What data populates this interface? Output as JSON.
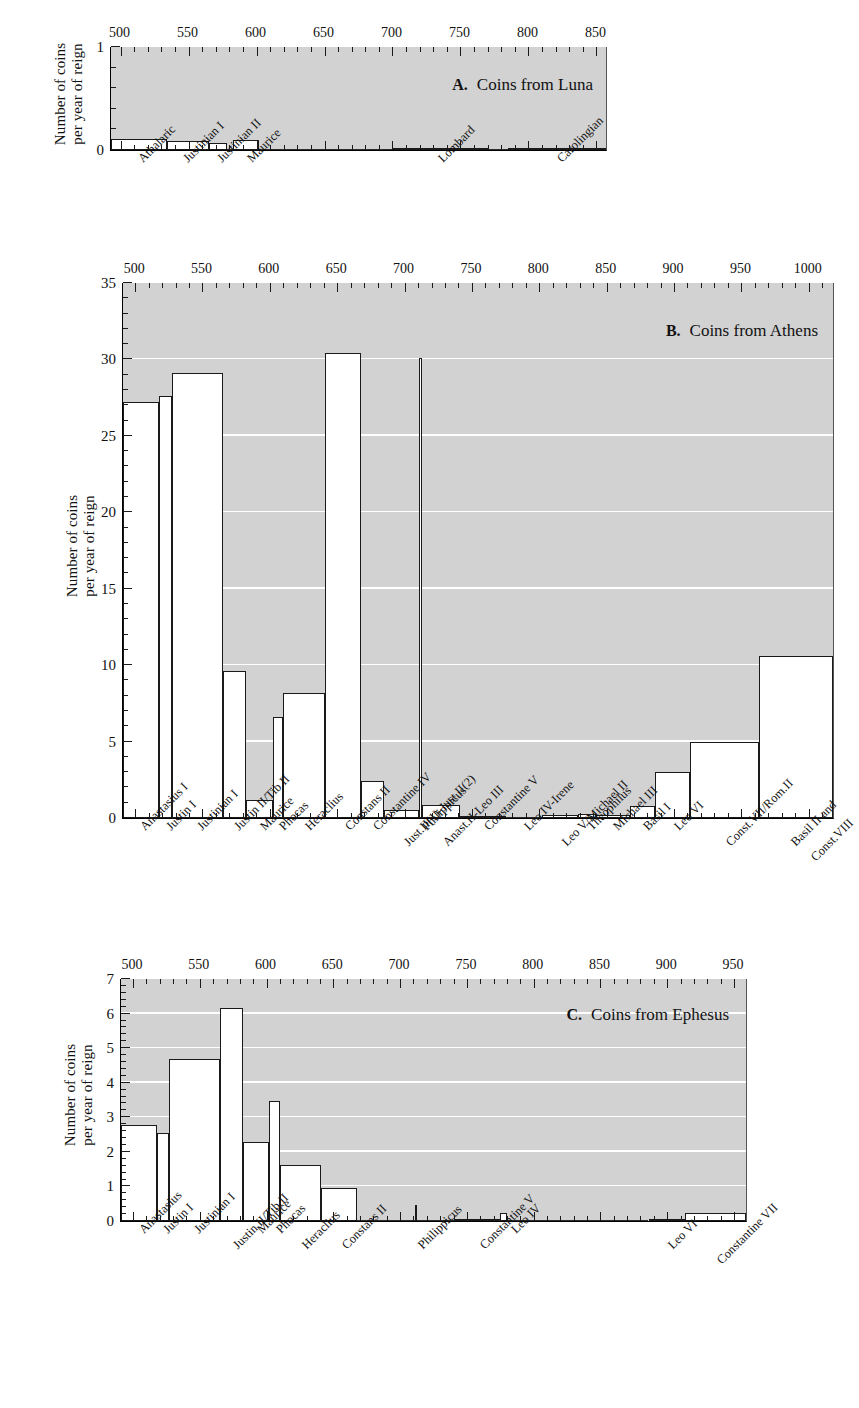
{
  "figure": {
    "y_axis_title_line1": "Number of coins",
    "y_axis_title_line2": "per year of reign"
  },
  "chart_data": [
    {
      "id": "A",
      "type": "bar",
      "title": "Coins from Luna",
      "panel_letter": "A.",
      "xlabel": "",
      "ylabel": "Number of coins per year of reign",
      "ylim": [
        0,
        1
      ],
      "yticks": [
        0,
        1
      ],
      "xlim": [
        493,
        857
      ],
      "xticks": [
        500,
        550,
        600,
        650,
        700,
        750,
        800,
        850
      ],
      "xtick_labels": [
        "500",
        "550",
        "600",
        "650",
        "700",
        "750",
        "800",
        "850"
      ],
      "minor_tick_step": 10,
      "grid": false,
      "categories": [
        "Athalaric",
        "Justinian I",
        "Justinian II",
        "Maurice",
        "Lombard",
        "Carolingian"
      ],
      "bars": [
        {
          "label": "Athalaric",
          "start": 493,
          "end": 534,
          "value": 0.105
        },
        {
          "label": "Justinian I",
          "start": 534,
          "end": 565,
          "value": 0.085
        },
        {
          "label": "Justinian II",
          "start": 565,
          "end": 578,
          "value": 0.065
        },
        {
          "label": "",
          "start": 578,
          "end": 583,
          "value": 0.0
        },
        {
          "label": "Maurice",
          "start": 583,
          "end": 602,
          "value": 0.095
        },
        {
          "label": "",
          "start": 602,
          "end": 700,
          "value": 0.005
        },
        {
          "label": "Lombard",
          "start": 700,
          "end": 770,
          "value": 0.018
        },
        {
          "label": "",
          "start": 770,
          "end": 785,
          "value": 0.004
        },
        {
          "label": "Carolingian",
          "start": 785,
          "end": 857,
          "value": 0.016
        }
      ]
    },
    {
      "id": "B",
      "type": "bar",
      "title": "Coins from Athens",
      "panel_letter": "B.",
      "xlabel": "",
      "ylabel": "Number of coins per year of reign",
      "ylim": [
        0,
        35
      ],
      "yticks": [
        0,
        5,
        10,
        15,
        20,
        25,
        30,
        35
      ],
      "ytick_labels": [
        "0",
        "5",
        "10",
        "15",
        "20",
        "25",
        "30",
        "35"
      ],
      "xlim": [
        491,
        1018
      ],
      "xticks": [
        500,
        550,
        600,
        650,
        700,
        750,
        800,
        850,
        900,
        950,
        1000
      ],
      "xtick_labels": [
        "500",
        "550",
        "600",
        "650",
        "700",
        "750",
        "800",
        "850",
        "900",
        "950",
        "1000"
      ],
      "minor_tick_step": 10,
      "grid": true,
      "gridlines": [
        5,
        10,
        15,
        20,
        25,
        30
      ],
      "categories": [
        "Anastasius I",
        "Justin I",
        "Justinian I",
        "Justin II/Tib.II",
        "Maurice",
        "Phocas",
        "Heraclius",
        "Constans II",
        "Constantine IV",
        "Just.II(1)-Just.II(2)",
        "Philippicus",
        "Anast.II-Leo III",
        "Constantine V",
        "Leo IV-Irene",
        "Leo V/Michael II",
        "Theophilus",
        "Michael III",
        "Basil I",
        "Leo VI",
        "Const.VII/Rom.II",
        "Basil II and Const.VIII"
      ],
      "bars": [
        {
          "label": "Anastasius I",
          "start": 491,
          "end": 518,
          "value": 27.2
        },
        {
          "label": "Justin I",
          "start": 518,
          "end": 527,
          "value": 27.6
        },
        {
          "label": "Justinian I",
          "start": 527,
          "end": 565,
          "value": 29.1
        },
        {
          "label": "Justin II/Tib.II",
          "start": 565,
          "end": 582,
          "value": 9.6
        },
        {
          "label": "Maurice",
          "start": 582,
          "end": 602,
          "value": 1.2
        },
        {
          "label": "Phocas",
          "start": 602,
          "end": 610,
          "value": 6.6
        },
        {
          "label": "Heraclius",
          "start": 610,
          "end": 641,
          "value": 8.2
        },
        {
          "label": "Constans II",
          "start": 641,
          "end": 668,
          "value": 30.4
        },
        {
          "label": "Constantine IV",
          "start": 668,
          "end": 685,
          "value": 2.4
        },
        {
          "label": "Just.II(1)-Just.II(2)",
          "start": 685,
          "end": 711,
          "value": 0.55
        },
        {
          "label": "Philippicus",
          "start": 711,
          "end": 713,
          "value": 30.1
        },
        {
          "label": "Anast.II-Leo III",
          "start": 713,
          "end": 741,
          "value": 0.85
        },
        {
          "label": "Constantine V",
          "start": 741,
          "end": 775,
          "value": 0.13
        },
        {
          "label": "Leo IV-Irene",
          "start": 775,
          "end": 802,
          "value": 0.07
        },
        {
          "label": "Leo V/Michael II",
          "start": 802,
          "end": 829,
          "value": 0.2
        },
        {
          "label": "Theophilus",
          "start": 829,
          "end": 842,
          "value": 0.28
        },
        {
          "label": "Michael III",
          "start": 842,
          "end": 867,
          "value": 0.18
        },
        {
          "label": "Basil I",
          "start": 867,
          "end": 886,
          "value": 0.8
        },
        {
          "label": "Leo VI",
          "start": 886,
          "end": 912,
          "value": 3.0
        },
        {
          "label": "Const.VII/Rom.II",
          "start": 912,
          "end": 963,
          "value": 5.0
        },
        {
          "label": "Basil II and Const.VIII",
          "start": 963,
          "end": 1018,
          "value": 10.6
        }
      ]
    },
    {
      "id": "C",
      "type": "bar",
      "title": "Coins from Ephesus",
      "panel_letter": "C.",
      "xlabel": "",
      "ylabel": "Number of coins per year of reign",
      "ylim": [
        0,
        7
      ],
      "yticks": [
        0,
        1,
        2,
        3,
        4,
        5,
        6,
        7
      ],
      "ytick_labels": [
        "0",
        "1",
        "2",
        "3",
        "4",
        "5",
        "6",
        "7"
      ],
      "xlim": [
        491,
        959
      ],
      "xticks": [
        500,
        550,
        600,
        650,
        700,
        750,
        800,
        850,
        900,
        950
      ],
      "xtick_labels": [
        "500",
        "550",
        "600",
        "650",
        "700",
        "750",
        "800",
        "850",
        "900",
        "950"
      ],
      "minor_tick_step": 10,
      "grid": true,
      "gridlines": [
        1,
        2,
        3,
        4,
        5,
        6
      ],
      "categories": [
        "Anastasius",
        "Justin I",
        "Justinian I",
        "Justin II/Tib.II",
        "Maurice",
        "Phocas",
        "Heraclius",
        "Constans II",
        "Philippicus",
        "Constantine V",
        "Leo IV",
        "Leo VI",
        "Constantine VII"
      ],
      "bars": [
        {
          "label": "Anastasius",
          "start": 491,
          "end": 518,
          "value": 2.78
        },
        {
          "label": "Justin I",
          "start": 518,
          "end": 527,
          "value": 2.55
        },
        {
          "label": "Justinian I",
          "start": 527,
          "end": 565,
          "value": 4.7
        },
        {
          "label": "Justin II/Tib.II",
          "start": 565,
          "end": 582,
          "value": 6.15
        },
        {
          "label": "Maurice",
          "start": 582,
          "end": 602,
          "value": 2.28
        },
        {
          "label": "Phocas",
          "start": 602,
          "end": 610,
          "value": 3.48
        },
        {
          "label": "Heraclius",
          "start": 610,
          "end": 641,
          "value": 1.62
        },
        {
          "label": "Constans II",
          "start": 641,
          "end": 668,
          "value": 0.95
        },
        {
          "label": "",
          "start": 668,
          "end": 711,
          "value": 0.02
        },
        {
          "label": "Philippicus",
          "start": 711,
          "end": 713,
          "value": 0.45
        },
        {
          "label": "",
          "start": 713,
          "end": 741,
          "value": 0.03
        },
        {
          "label": "Constantine V",
          "start": 741,
          "end": 775,
          "value": 0.06
        },
        {
          "label": "Leo IV",
          "start": 775,
          "end": 780,
          "value": 0.22
        },
        {
          "label": "",
          "start": 780,
          "end": 886,
          "value": 0.0
        },
        {
          "label": "Leo VI",
          "start": 886,
          "end": 913,
          "value": 0.07
        },
        {
          "label": "Constantine VII",
          "start": 913,
          "end": 959,
          "value": 0.22
        }
      ]
    }
  ],
  "category_labels": {
    "A": [
      {
        "text": "Athalaric",
        "x": 512
      },
      {
        "text": "Justinian I",
        "x": 545
      },
      {
        "text": "Justinian II",
        "x": 570
      },
      {
        "text": "Maurice",
        "x": 592
      },
      {
        "text": "Lombard",
        "x": 733
      },
      {
        "text": "Carolingian",
        "x": 820
      }
    ],
    "B": [
      {
        "text": "Anastasius I",
        "x": 503,
        "row": 0
      },
      {
        "text": "Justin I",
        "x": 522,
        "row": 0
      },
      {
        "text": "Justinian I",
        "x": 545,
        "row": 0
      },
      {
        "text": "Justin II/Tib.II",
        "x": 573,
        "row": 0
      },
      {
        "text": "Maurice",
        "x": 592,
        "row": 0
      },
      {
        "text": "Phocas",
        "x": 606,
        "row": 0
      },
      {
        "text": "Heraclius",
        "x": 625,
        "row": 0
      },
      {
        "text": "Constans II",
        "x": 655,
        "row": 0
      },
      {
        "text": "Constantine IV",
        "x": 676,
        "row": 0
      },
      {
        "text": "Just.II(1)-Just.II(2)",
        "x": 698,
        "row": 1
      },
      {
        "text": "Philippicus",
        "x": 712,
        "row": 0
      },
      {
        "text": "Anast.II-Leo III",
        "x": 727,
        "row": 1
      },
      {
        "text": "Constantine V",
        "x": 758,
        "row": 0
      },
      {
        "text": "Leo IV-Irene",
        "x": 788,
        "row": 0
      },
      {
        "text": "Leo V/Michael II",
        "x": 815,
        "row": 1
      },
      {
        "text": "Theophilus",
        "x": 835,
        "row": 0
      },
      {
        "text": "Michael III",
        "x": 854,
        "row": 0
      },
      {
        "text": "Basil I",
        "x": 876,
        "row": 0
      },
      {
        "text": "Leo VI",
        "x": 899,
        "row": 0
      },
      {
        "text": "Const.VII/Rom.II",
        "x": 937,
        "row": 1
      },
      {
        "text": "Basil II and",
        "x": 985,
        "row": 1
      },
      {
        "text": "Const.VIII",
        "x": 1000,
        "row": 2
      }
    ],
    "C": [
      {
        "text": "Anastasius",
        "x": 504,
        "row": 0
      },
      {
        "text": "Justin I",
        "x": 522,
        "row": 0
      },
      {
        "text": "Justinian I",
        "x": 545,
        "row": 0
      },
      {
        "text": "Justin II/Tib.II",
        "x": 573,
        "row": 1
      },
      {
        "text": "Maurice",
        "x": 592,
        "row": 0
      },
      {
        "text": "Phocas",
        "x": 606,
        "row": 0
      },
      {
        "text": "Heraclius",
        "x": 625,
        "row": 1
      },
      {
        "text": "Constans II",
        "x": 655,
        "row": 1
      },
      {
        "text": "Philippicus",
        "x": 712,
        "row": 1
      },
      {
        "text": "Constantine V",
        "x": 758,
        "row": 1
      },
      {
        "text": "Leo IV",
        "x": 782,
        "row": 0
      },
      {
        "text": "Leo VI",
        "x": 899,
        "row": 1
      },
      {
        "text": "Constantine VII",
        "x": 936,
        "row": 2
      }
    ]
  }
}
